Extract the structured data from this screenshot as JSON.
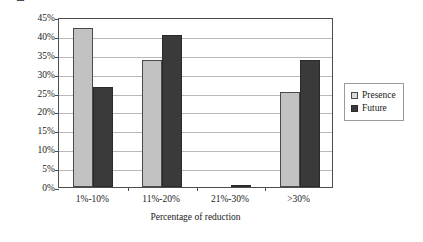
{
  "chart_data": {
    "type": "bar",
    "title": "",
    "xlabel": "Percentage of reduction",
    "ylabel": "Percentage of participants",
    "categories": [
      "1%-10%",
      "11%-20%",
      "21%-30%",
      ">30%"
    ],
    "series": [
      {
        "name": "Presence",
        "color": "#c2c2c2",
        "values": [
          42.0,
          33.5,
          0.0,
          25.2
        ]
      },
      {
        "name": "Future",
        "color": "#3a3a3a",
        "values": [
          26.5,
          40.2,
          0.4,
          33.7
        ]
      }
    ],
    "ylim": [
      0,
      45
    ],
    "ytick_values": [
      0,
      5,
      10,
      15,
      20,
      25,
      30,
      35,
      40,
      45
    ],
    "ytick_labels": [
      "0%",
      "5%",
      "10%",
      "15%",
      "20%",
      "25%",
      "30%",
      "35%",
      "40%",
      "45%"
    ],
    "grid": true,
    "legend_position": "right"
  },
  "legend": {
    "items": [
      {
        "label": "Presence"
      },
      {
        "label": "Future"
      }
    ]
  }
}
